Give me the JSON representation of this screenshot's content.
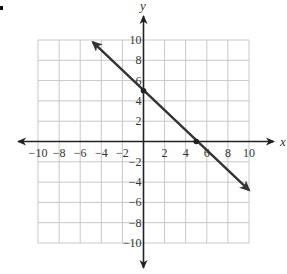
{
  "chart_data": {
    "type": "line",
    "title": "",
    "xlabel": "x",
    "ylabel": "y",
    "xlim": [
      -10,
      10
    ],
    "ylim": [
      -10,
      10
    ],
    "grid": true,
    "grid_step": 2,
    "x_ticks": [
      "-10",
      "-8",
      "-6",
      "-4",
      "-2",
      "2",
      "4",
      "6",
      "8",
      "10"
    ],
    "y_ticks": [
      "10",
      "8",
      "6",
      "4",
      "2",
      "-2",
      "-4",
      "-6",
      "-8",
      "-10"
    ],
    "series": [
      {
        "name": "line",
        "equation": "y = -x + 5",
        "arrows": "both",
        "x": [
          -4.8,
          0,
          5,
          10
        ],
        "y": [
          9.8,
          5,
          0,
          -4.8
        ],
        "marked_points": [
          [
            0,
            5
          ],
          [
            5,
            0
          ]
        ]
      }
    ],
    "colors": {
      "line": "#333333",
      "grid": "#c8c8c8",
      "axes": "#222222"
    }
  },
  "labels": {
    "x_axis": "x",
    "y_axis": "y"
  }
}
